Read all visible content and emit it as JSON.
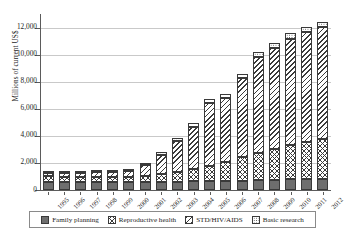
{
  "chart_data": {
    "type": "bar",
    "subtype": "stacked-bar",
    "title": "",
    "xlabel": "",
    "ylabel": "Millions of current US$",
    "ylim": [
      0,
      13000
    ],
    "yticks": [
      0,
      2000,
      4000,
      6000,
      8000,
      10000,
      12000
    ],
    "ytick_labels": [
      "0",
      "2,000",
      "4,000",
      "6,000",
      "8,000",
      "10,000",
      "12,000"
    ],
    "grid": true,
    "legend_position": "bottom",
    "categories": [
      "1995",
      "1996",
      "1997",
      "1998",
      "1999",
      "2000",
      "2001",
      "2002",
      "2003",
      "2004",
      "2005",
      "2006",
      "2007",
      "2008",
      "2009",
      "2010",
      "2011",
      "2012"
    ],
    "series": [
      {
        "name": "Family planning",
        "pattern": "solid-gray",
        "color": "#6e6e6e",
        "values": [
          620,
          600,
          590,
          580,
          570,
          560,
          570,
          590,
          620,
          640,
          660,
          680,
          700,
          730,
          760,
          790,
          810,
          840
        ]
      },
      {
        "name": "Reproductive health",
        "pattern": "crosshatch",
        "color": "#ffffff",
        "values": [
          390,
          380,
          390,
          390,
          400,
          420,
          470,
          560,
          720,
          900,
          1150,
          1400,
          1750,
          2000,
          2300,
          2550,
          2750,
          2950
        ]
      },
      {
        "name": "STD/HIV/AIDS",
        "pattern": "diagonal-hatch",
        "color": "#ffffff",
        "values": [
          220,
          260,
          300,
          330,
          370,
          420,
          780,
          1450,
          2250,
          3150,
          4600,
          4700,
          5800,
          7100,
          7400,
          7850,
          8100,
          8250
        ]
      },
      {
        "name": "Basic research",
        "pattern": "dotted",
        "color": "#ffffff",
        "values": [
          120,
          120,
          130,
          130,
          130,
          140,
          150,
          180,
          240,
          270,
          300,
          320,
          340,
          360,
          370,
          380,
          390,
          400
        ]
      }
    ],
    "totals": [
      1350,
      1360,
      1410,
      1430,
      1470,
      1540,
      1970,
      2780,
      3830,
      4960,
      6710,
      7100,
      8590,
      10190,
      10830,
      11570,
      12050,
      12440
    ]
  },
  "legend": {
    "items": [
      {
        "label": "Family planning",
        "swatch": "solid-gray-swatch"
      },
      {
        "label": "Reproductive health",
        "swatch": "crosshatch-swatch"
      },
      {
        "label": "STD/HIV/AIDS",
        "swatch": "diagonal-hatch-swatch"
      },
      {
        "label": "Basic research",
        "swatch": "dotted-swatch"
      }
    ]
  }
}
